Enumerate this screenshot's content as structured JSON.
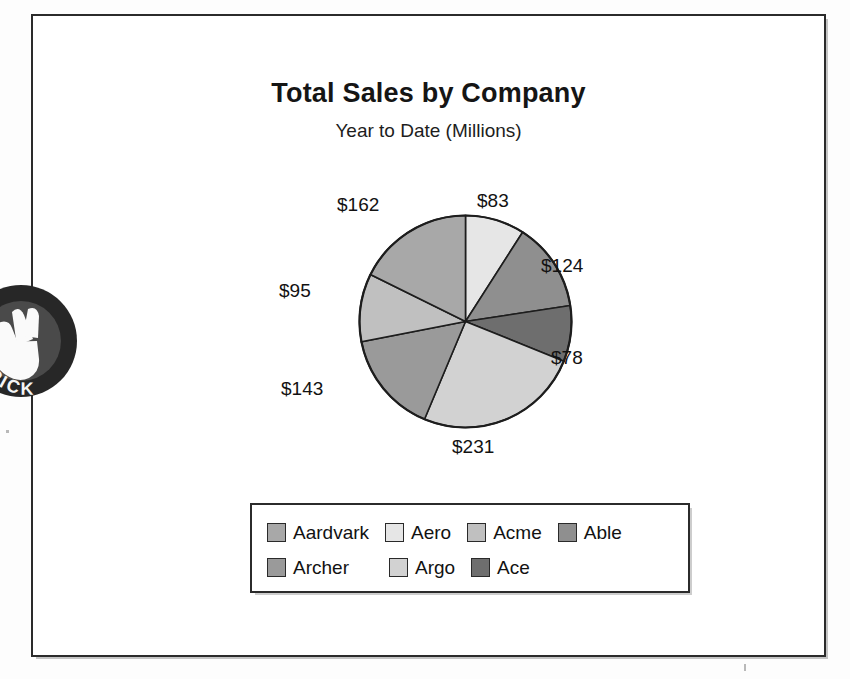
{
  "document": {
    "type": "scanned-chart-figure"
  },
  "chart_data": {
    "type": "pie",
    "title": "Total Sales by Company",
    "subtitle": "Year to Date (Millions)",
    "xlabel": "",
    "ylabel": "",
    "legend_position": "bottom",
    "grid": false,
    "units": "Millions USD",
    "total": 916,
    "categories": [
      "Aero",
      "Able",
      "Ace",
      "Argo",
      "Archer",
      "Acme",
      "Aardvark"
    ],
    "values": [
      83,
      124,
      78,
      231,
      143,
      95,
      162
    ],
    "labels": [
      "$83",
      "$124",
      "$78",
      "$231",
      "$143",
      "$95",
      "$162"
    ],
    "series": [
      {
        "name": "Total Sales",
        "values": [
          83,
          124,
          78,
          231,
          143,
          95,
          162
        ]
      }
    ],
    "slices": [
      {
        "company": "Aero",
        "value": 83,
        "label": "$83",
        "color": "#e6e6e6",
        "start_deg": 0,
        "end_deg": 32.62
      },
      {
        "company": "Able",
        "value": 124,
        "label": "$124",
        "color": "#8f8f8f",
        "start_deg": 32.62,
        "end_deg": 81.35
      },
      {
        "company": "Ace",
        "value": 78,
        "label": "$78",
        "color": "#6e6e6e",
        "start_deg": 81.35,
        "end_deg": 111.99
      },
      {
        "company": "Argo",
        "value": 231,
        "label": "$231",
        "color": "#d2d2d2",
        "start_deg": 111.99,
        "end_deg": 202.77
      },
      {
        "company": "Archer",
        "value": 143,
        "label": "$143",
        "color": "#9a9a9a",
        "start_deg": 202.77,
        "end_deg": 258.97
      },
      {
        "company": "Acme",
        "value": 95,
        "label": "$95",
        "color": "#c0c0c0",
        "start_deg": 258.97,
        "end_deg": 296.29
      },
      {
        "company": "Aardvark",
        "value": 162,
        "label": "$162",
        "color": "#a8a8a8",
        "start_deg": 296.29,
        "end_deg": 360
      }
    ]
  },
  "legend": {
    "rows": [
      [
        {
          "label": "Aardvark",
          "color": "#a8a8a8"
        },
        {
          "label": "Aero",
          "color": "#e6e6e6"
        },
        {
          "label": "Acme",
          "color": "#c0c0c0"
        },
        {
          "label": "Able",
          "color": "#8f8f8f"
        }
      ],
      [
        {
          "label": "Archer",
          "color": "#9a9a9a"
        },
        {
          "label": "Argo",
          "color": "#d2d2d2"
        },
        {
          "label": "Ace",
          "color": "#6e6e6e"
        }
      ]
    ]
  },
  "stamp": {
    "text_top": "S",
    "text_bottom": "RICK",
    "color": "#272727"
  },
  "colors": {
    "ink": "#121212",
    "frame": "#2b2b2b",
    "paper": "#ffffff"
  }
}
